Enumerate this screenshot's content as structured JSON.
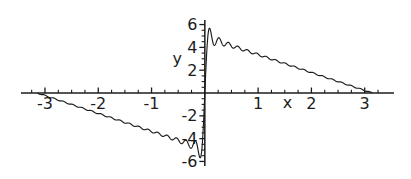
{
  "window": {
    "width": 411,
    "height": 179,
    "background": "#ffffff"
  },
  "chart_data": {
    "type": "line",
    "title": "",
    "xlabel": "x",
    "ylabel": "y",
    "xlim": [
      -3.45,
      3.55
    ],
    "ylim": [
      -6.4,
      6.4
    ],
    "x_major_ticks": [
      -3,
      -2,
      -1,
      1,
      2,
      3
    ],
    "x_major_tick_labels": [
      "-3",
      "-2",
      "-1",
      "1",
      "2",
      "3"
    ],
    "x_minor_step": 0.25,
    "y_major_ticks": [
      -6,
      -4,
      -2,
      2,
      4,
      6
    ],
    "y_major_tick_labels": [
      "-6",
      "-4",
      "-2",
      "2",
      "4",
      "6"
    ],
    "y_minor_step": 0.5,
    "grid": false,
    "legend": false,
    "axis_color": "#1c1c1c",
    "line_color": "#1c1c1c",
    "label_color": "#1c1c1c",
    "xlabel_pos": [
      1.55,
      -0.92
    ],
    "ylabel_pos": [
      -0.52,
      3.1
    ],
    "series": [
      {
        "name": "fourier-partial-sum",
        "description": "Partial Fourier sine series of the odd sawtooth y = pi*(pi-x)/2 on (0,pi); linear branch from (-pi,0) down to (0,-4.93) and from (0,4.93) down to (pi,0), with Gibbs-phenomenon oscillations hugging the y-axis near x=0, overshooting to about y=+/-5.8",
        "formula": "y = sum_{n=1}^{N} (pi/n) * sin(n*x)",
        "terms": 35,
        "domain": [
          -3.14159265,
          3.14159265
        ],
        "samples": 2400,
        "key_points": [
          [
            -3.1416,
            0.0
          ],
          [
            -1.0,
            -3.36
          ],
          [
            0.0,
            -4.93
          ],
          [
            0.0,
            4.93
          ],
          [
            1.0,
            3.36
          ],
          [
            3.1416,
            0.0
          ]
        ],
        "gibbs_overshoot_abs": 5.8
      }
    ]
  }
}
